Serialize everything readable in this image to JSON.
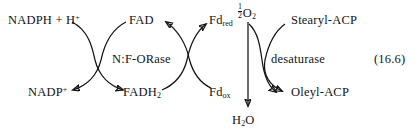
{
  "figure": {
    "equation_number": "(16.6)",
    "enzymes": {
      "left": "N:F-ORase",
      "right": "desaturase"
    },
    "metabolites": {
      "nadph": "NADPH + H",
      "nadph_charge": "+",
      "nadp": "NADP",
      "nadp_charge": "+",
      "fad": "FAD",
      "fadh2_base": "FADH",
      "fadh2_sub": "2",
      "fd_red_base": "Fd",
      "fd_red_sub": "red",
      "fd_ox_base": "Fd",
      "fd_ox_sub": "ox",
      "oxygen_num": "1",
      "oxygen_den": "2",
      "oxygen_base": "O",
      "oxygen_sub": "2",
      "water_h": "H",
      "water_sub": "2",
      "water_o": "O",
      "stearyl": "Stearyl-ACP",
      "oleyl": "Oleyl-ACP"
    },
    "colors": {
      "ink": "#141414",
      "background": "#ffffff"
    }
  }
}
